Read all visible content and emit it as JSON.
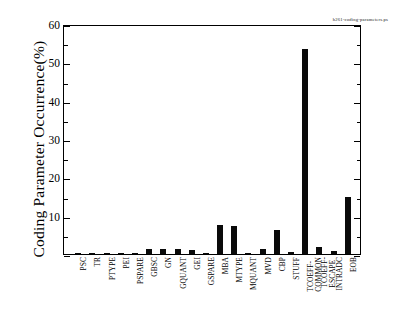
{
  "figure": {
    "annotation": "h261-coding-parameters.ps",
    "ylabel": "Coding Parameter Occurrence(%)"
  },
  "chart_data": {
    "type": "bar",
    "title": "",
    "xlabel": "",
    "ylabel": "Coding Parameter Occurrence(%)",
    "ylim": [
      0,
      60
    ],
    "ytick_values": [
      0,
      10,
      20,
      30,
      40,
      50,
      60
    ],
    "ytick_labels": [
      "0",
      "10",
      "20",
      "30",
      "40",
      "50",
      "60"
    ],
    "yminor_step": 5,
    "grid": false,
    "legend": false,
    "bar_color": "#0a0a0a",
    "categories": [
      "PSC",
      "TR",
      "PTYPE",
      "PEI",
      "PSPARE",
      "GBSC",
      "GN",
      "GQUANT",
      "GEI",
      "GSPARE",
      "MBA",
      "MTYPE",
      "MQUANT",
      "MVD",
      "CBP",
      "STUFF",
      "TCOEFF-\nCOMMON",
      "TCOEFF-\nESCAPE",
      "INTRADC",
      "EOB"
    ],
    "category_lines": [
      [
        "PSC"
      ],
      [
        "TR"
      ],
      [
        "PTYPE"
      ],
      [
        "PEI"
      ],
      [
        "PSPARE"
      ],
      [
        "GBSC"
      ],
      [
        "GN"
      ],
      [
        "GQUANT"
      ],
      [
        "GEI"
      ],
      [
        "GSPARE"
      ],
      [
        "MBA"
      ],
      [
        "MTYPE"
      ],
      [
        "MQUANT"
      ],
      [
        "MVD"
      ],
      [
        "CBP"
      ],
      [
        "STUFF"
      ],
      [
        "TCOEFF-",
        "COMMON"
      ],
      [
        "TCOEFF-",
        "ESCAPE"
      ],
      [
        "INTRADC"
      ],
      [
        "EOB"
      ]
    ],
    "values": [
      0.12,
      0.2,
      0.22,
      0.2,
      0.1,
      1.2,
      1.2,
      1.2,
      1.1,
      0.1,
      7.5,
      7.3,
      0.2,
      1.4,
      6.3,
      0.4,
      53.5,
      1.7,
      0.8,
      15.0
    ]
  }
}
